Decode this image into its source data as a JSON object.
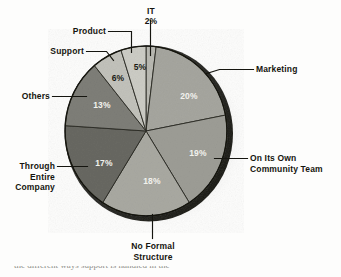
{
  "figure": {
    "kind": "pie-chart-scan",
    "background_color": "#fdfdfc",
    "bottom_text_fragment": "the different ways support is handled in the"
  },
  "chart_data": {
    "type": "pie",
    "title": "",
    "subtitle": "",
    "xlabel": "",
    "ylabel": "",
    "legend_position": "none",
    "grid": false,
    "start_angle_deg": 0,
    "direction": "clockwise",
    "units": "percent",
    "total": 100,
    "categories": [
      "IT",
      "Marketing",
      "On Its Own Community Team",
      "No Formal Structure",
      "Through Entire Company",
      "Others",
      "Support",
      "Product"
    ],
    "values": [
      2,
      20,
      19,
      18,
      17,
      13,
      6,
      5
    ],
    "value_labels": [
      "2%",
      "20%",
      "19%",
      "18%",
      "17%",
      "13%",
      "6%",
      "5%"
    ],
    "slices": [
      {
        "label": "IT",
        "value": 2,
        "value_label": "2%",
        "color": "#b9b9b2",
        "label_text_color": "#15150f",
        "value_text_color": "#15150f",
        "value_inside_slice": false
      },
      {
        "label": "Marketing",
        "value": 20,
        "value_label": "20%",
        "color": "#a6a69f",
        "label_text_color": "#15150f",
        "value_text_color": "#f2f2ee",
        "value_inside_slice": true
      },
      {
        "label": "On Its Own\nCommunity Team",
        "value": 19,
        "value_label": "19%",
        "color": "#9d9d96",
        "label_text_color": "#15150f",
        "value_text_color": "#f2f2ee",
        "value_inside_slice": true
      },
      {
        "label": "No Formal\nStructure",
        "value": 18,
        "value_label": "18%",
        "color": "#a9a9a2",
        "label_text_color": "#15150f",
        "value_text_color": "#f2f2ee",
        "value_inside_slice": true
      },
      {
        "label": "Through\nEntire\nCompany",
        "value": 17,
        "value_label": "17%",
        "color": "#686862",
        "label_text_color": "#15150f",
        "value_text_color": "#f2f2ee",
        "value_inside_slice": true
      },
      {
        "label": "Others",
        "value": 13,
        "value_label": "13%",
        "color": "#7e7e78",
        "label_text_color": "#15150f",
        "value_text_color": "#f2f2ee",
        "value_inside_slice": true
      },
      {
        "label": "Support",
        "value": 6,
        "value_label": "6%",
        "color": "#c2c2bb",
        "label_text_color": "#15150f",
        "value_text_color": "#1a1a14",
        "value_inside_slice": true
      },
      {
        "label": "Product",
        "value": 5,
        "value_label": "5%",
        "color": "#ccccc5",
        "label_text_color": "#15150f",
        "value_text_color": "#1a1a14",
        "value_inside_slice": true
      }
    ]
  },
  "labels": {
    "it": "IT",
    "it_pct": "2%",
    "product": "Product",
    "support": "Support",
    "others": "Others",
    "through_entire_company": "Through\nEntire\nCompany",
    "no_formal_structure": "No Formal\nStructure",
    "on_its_own_community_team": "On Its Own\nCommunity Team",
    "marketing": "Marketing"
  },
  "values": {
    "marketing": "20%",
    "community_team": "19%",
    "no_formal": "18%",
    "through_entire": "17%",
    "others": "13%",
    "support": "6%",
    "product": "5%"
  }
}
